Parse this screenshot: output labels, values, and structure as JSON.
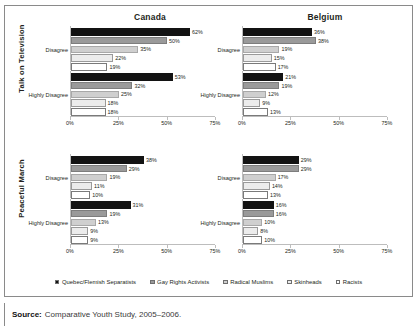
{
  "figure": {
    "source_prefix": "Source:",
    "source_text": "Comparative Youth Study, 2005–2006."
  },
  "columns": [
    {
      "key": "canada",
      "title": "Canada"
    },
    {
      "key": "belgium",
      "title": "Belgium"
    }
  ],
  "sections": [
    {
      "key": "tv",
      "label": "Talk on Television"
    },
    {
      "key": "march",
      "label": "Peaceful March"
    }
  ],
  "groups": [
    {
      "key": "disagree",
      "label": "Disagree"
    },
    {
      "key": "highly_disagree",
      "label": "Highly Disagree"
    }
  ],
  "legend": {
    "items": [
      {
        "name": "Quebec/Flemish Separatists",
        "color": "#131313"
      },
      {
        "name": "Gay Rights Activists",
        "color": "#9a9a9a"
      },
      {
        "name": "Radical Muslims",
        "color": "#cfcfcf"
      },
      {
        "name": "Skinheads",
        "color": "#ececec"
      },
      {
        "name": "Racists",
        "color": "#ffffff"
      }
    ]
  },
  "axis": {
    "min": 0,
    "max": 75,
    "ticks": [
      0,
      25,
      50,
      75
    ],
    "tick_labels": [
      "0%",
      "25%",
      "50%",
      "75%"
    ]
  },
  "chart_data": {
    "type": "bar",
    "orientation": "horizontal",
    "title": "",
    "xlabel": "",
    "ylabel": "",
    "xlim": [
      0,
      75
    ],
    "grid": false,
    "legend_position": "bottom",
    "series": [
      "Quebec/Flemish Separatists",
      "Gay Rights Activists",
      "Radical Muslims",
      "Skinheads",
      "Racists"
    ],
    "panels": [
      {
        "section": "Talk on Television",
        "country": "Canada",
        "group": "Disagree",
        "values": [
          62,
          50,
          35,
          22,
          19
        ],
        "labels": [
          "62%",
          "50%",
          "35%",
          "22%",
          "19%"
        ]
      },
      {
        "section": "Talk on Television",
        "country": "Canada",
        "group": "Highly Disagree",
        "values": [
          53,
          32,
          25,
          18,
          18
        ],
        "labels": [
          "53%",
          "32%",
          "25%",
          "18%",
          "18%"
        ]
      },
      {
        "section": "Talk on Television",
        "country": "Belgium",
        "group": "Disagree",
        "values": [
          36,
          38,
          19,
          15,
          17
        ],
        "labels": [
          "36%",
          "38%",
          "19%",
          "15%",
          "17%"
        ]
      },
      {
        "section": "Talk on Television",
        "country": "Belgium",
        "group": "Highly Disagree",
        "values": [
          21,
          19,
          12,
          9,
          13
        ],
        "labels": [
          "21%",
          "19%",
          "12%",
          "9%",
          "13%"
        ]
      },
      {
        "section": "Peaceful March",
        "country": "Canada",
        "group": "Disagree",
        "values": [
          38,
          29,
          19,
          11,
          10
        ],
        "labels": [
          "38%",
          "29%",
          "19%",
          "11%",
          "10%"
        ]
      },
      {
        "section": "Peaceful March",
        "country": "Canada",
        "group": "Highly Disagree",
        "values": [
          31,
          19,
          13,
          9,
          9
        ],
        "labels": [
          "31%",
          "19%",
          "13%",
          "9%",
          "9%"
        ]
      },
      {
        "section": "Peaceful March",
        "country": "Belgium",
        "group": "Disagree",
        "values": [
          29,
          29,
          17,
          14,
          13
        ],
        "labels": [
          "29%",
          "29%",
          "17%",
          "14%",
          "13%"
        ]
      },
      {
        "section": "Peaceful March",
        "country": "Belgium",
        "group": "Highly Disagree",
        "values": [
          16,
          16,
          10,
          8,
          10
        ],
        "labels": [
          "16%",
          "16%",
          "10%",
          "8%",
          "10%"
        ]
      }
    ]
  }
}
